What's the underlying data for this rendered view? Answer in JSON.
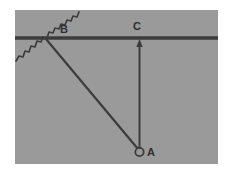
{
  "figure": {
    "canvas": {
      "width": 233,
      "height": 175,
      "background": "#ffffff"
    },
    "panel": {
      "name": "diagram-panel",
      "x": 15,
      "y": 10,
      "width": 203,
      "height": 154,
      "fill": "#9a9a9a"
    },
    "stroke_color": "#3c3c3c",
    "labels": {
      "point_a": "A",
      "point_b": "B",
      "point_c": "C"
    },
    "elements": {
      "surface_line_name": "horizontal-surface-line",
      "squiggle_name": "zigzag-string-line",
      "rod_name": "pendulum-rod-line",
      "riser_name": "vertical-arrow-line",
      "bob_name": "pendulum-bob-circle",
      "arrow_name": "up-arrowhead"
    },
    "geometry": {
      "surface_y": 38,
      "surface_x1": 15,
      "surface_x2": 218,
      "point_b": {
        "x": 46,
        "y": 38
      },
      "point_c": {
        "x": 140,
        "y": 38
      },
      "point_a": {
        "x": 139.5,
        "y": 152
      },
      "bob_radius": 4.2,
      "label_a_x": 151,
      "label_a_y": 156,
      "label_b_x": 64,
      "label_b_y": 33,
      "label_c_x": 135,
      "label_c_y": 30
    }
  }
}
